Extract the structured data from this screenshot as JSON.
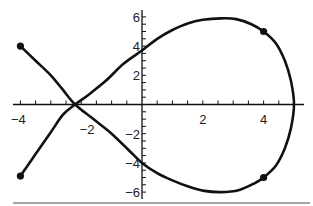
{
  "chart_data": {
    "type": "line",
    "title": "",
    "xlabel": "",
    "ylabel": "",
    "xlim": [
      -4.3,
      5.3
    ],
    "ylim": [
      -6.5,
      6.5
    ],
    "grid": false,
    "legend": null,
    "x_ticks": [
      -4,
      -2,
      2,
      4
    ],
    "x_tick_labels": [
      "−4",
      "−2",
      "2",
      "4"
    ],
    "y_ticks": [
      -6,
      -4,
      -2,
      2,
      4,
      6
    ],
    "y_tick_labels": [
      "−6",
      "−4",
      "−2",
      "2",
      "4",
      "6"
    ],
    "x_minor_step": 0.5,
    "y_minor_step": 0.5,
    "series": [
      {
        "name": "parametric curve",
        "closed": false,
        "points": [
          [
            -4.0,
            4.0
          ],
          [
            -3.5,
            3.0
          ],
          [
            -3.0,
            2.0
          ],
          [
            -2.6,
            1.0
          ],
          [
            -2.2,
            0.0
          ],
          [
            -1.6,
            -1.0
          ],
          [
            -1.0,
            -2.0
          ],
          [
            -0.4,
            -3.2
          ],
          [
            0.0,
            -4.0
          ],
          [
            0.5,
            -4.7
          ],
          [
            1.0,
            -5.2
          ],
          [
            1.5,
            -5.6
          ],
          [
            2.0,
            -5.9
          ],
          [
            2.6,
            -6.0
          ],
          [
            3.2,
            -5.85
          ],
          [
            3.7,
            -5.4
          ],
          [
            4.0,
            -5.0
          ],
          [
            4.4,
            -4.2
          ],
          [
            4.7,
            -3.0
          ],
          [
            4.9,
            -1.6
          ],
          [
            5.0,
            0.0
          ],
          [
            4.9,
            1.6
          ],
          [
            4.7,
            3.0
          ],
          [
            4.4,
            4.2
          ],
          [
            4.0,
            5.0
          ],
          [
            3.6,
            5.5
          ],
          [
            3.1,
            5.85
          ],
          [
            2.6,
            5.9
          ],
          [
            2.0,
            5.8
          ],
          [
            1.5,
            5.55
          ],
          [
            1.0,
            5.1
          ],
          [
            0.5,
            4.5
          ],
          [
            0.0,
            3.7
          ],
          [
            -0.6,
            2.8
          ],
          [
            -1.2,
            1.6
          ],
          [
            -1.8,
            0.6
          ],
          [
            -2.2,
            0.0
          ],
          [
            -2.6,
            -0.7
          ],
          [
            -3.0,
            -1.9
          ],
          [
            -3.5,
            -3.4
          ],
          [
            -4.0,
            -4.9
          ]
        ]
      }
    ],
    "marked_points": [
      {
        "x": -4,
        "y": 4
      },
      {
        "x": -4,
        "y": -4.9
      },
      {
        "x": 4,
        "y": 5
      },
      {
        "x": 4,
        "y": -5
      }
    ],
    "annotations": []
  }
}
